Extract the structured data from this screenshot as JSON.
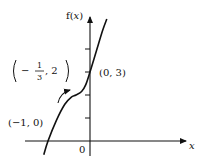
{
  "chart_data": {
    "type": "line",
    "title": "",
    "xlabel": "x",
    "ylabel": "f(x)",
    "origin_label": "0",
    "xlim": [
      -1.25,
      2.2
    ],
    "ylim": [
      -0.6,
      5.3
    ],
    "y_ticks": [
      1,
      2,
      3,
      4
    ],
    "grid": false,
    "legend": null,
    "series": [
      {
        "name": "f(x)",
        "description": "increasing cubic with inflection point",
        "x": [
          -1.1,
          -1.0,
          -0.8,
          -0.6,
          -0.45,
          -0.333,
          -0.2,
          -0.1,
          0.0,
          0.15,
          0.3,
          0.4
        ],
        "y": [
          -0.6,
          0.0,
          0.9,
          1.6,
          1.9,
          2.0,
          2.15,
          2.45,
          3.0,
          3.9,
          4.8,
          5.3
        ]
      }
    ],
    "annotations": [
      {
        "label": "(−1, 0)",
        "x": -1,
        "y": 0
      },
      {
        "label": "(0, 3)",
        "x": 0,
        "y": 3
      },
      {
        "label_prefix": "−",
        "label_num": "1",
        "label_den": "3",
        "label_suffix": ", 2",
        "x": -0.333,
        "y": 2,
        "note": "inflection point with curved arrow"
      }
    ]
  }
}
